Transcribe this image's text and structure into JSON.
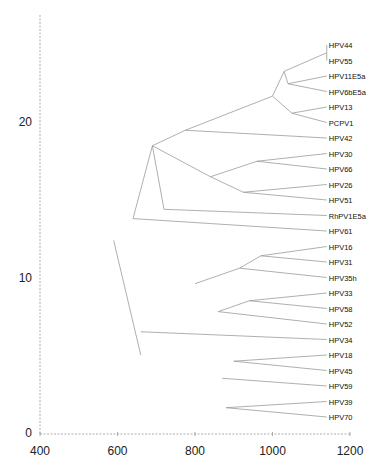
{
  "chart_data": {
    "type": "dendrogram",
    "title": "",
    "xlabel": "",
    "ylabel": "",
    "xlim": [
      400,
      1200
    ],
    "ylim": [
      0,
      25
    ],
    "x_ticks": [
      400,
      600,
      800,
      1000,
      1200
    ],
    "y_ticks": [
      0,
      10,
      20
    ],
    "grid": false,
    "leaves": [
      {
        "name": "HPV44",
        "x": 1140,
        "y": 25.0
      },
      {
        "name": "HPV55",
        "x": 1140,
        "y": 24.0
      },
      {
        "name": "HPV11E5a",
        "x": 1140,
        "y": 23.0
      },
      {
        "name": "HPV6bE5a",
        "x": 1140,
        "y": 22.0
      },
      {
        "name": "HPV13",
        "x": 1140,
        "y": 21.0
      },
      {
        "name": "PCPV1",
        "x": 1140,
        "y": 20.0
      },
      {
        "name": "HPV42",
        "x": 1140,
        "y": 19.0
      },
      {
        "name": "HPV30",
        "x": 1140,
        "y": 18.0
      },
      {
        "name": "HPV66",
        "x": 1140,
        "y": 17.0
      },
      {
        "name": "HPV26",
        "x": 1140,
        "y": 16.0
      },
      {
        "name": "HPV51",
        "x": 1140,
        "y": 15.0
      },
      {
        "name": "RhPV1E5a",
        "x": 1140,
        "y": 14.0
      },
      {
        "name": "HPV61",
        "x": 1140,
        "y": 13.0
      },
      {
        "name": "HPV16",
        "x": 1140,
        "y": 12.0
      },
      {
        "name": "HPV31",
        "x": 1140,
        "y": 11.0
      },
      {
        "name": "HPV35h",
        "x": 1140,
        "y": 10.0
      },
      {
        "name": "HPV33",
        "x": 1140,
        "y": 9.0
      },
      {
        "name": "HPV58",
        "x": 1140,
        "y": 8.0
      },
      {
        "name": "HPV52",
        "x": 1140,
        "y": 7.0
      },
      {
        "name": "HPV34",
        "x": 1140,
        "y": 6.0
      },
      {
        "name": "HPV18",
        "x": 1140,
        "y": 5.0
      },
      {
        "name": "HPV45",
        "x": 1140,
        "y": 4.0
      },
      {
        "name": "HPV59",
        "x": 1140,
        "y": 3.0
      },
      {
        "name": "HPV39",
        "x": 1140,
        "y": 2.0
      },
      {
        "name": "HPV70",
        "x": 1140,
        "y": 1.0
      }
    ],
    "branches": [
      [
        [
          1140,
          24.5
        ],
        [
          1140,
          25.0
        ]
      ],
      [
        [
          1140,
          24.5
        ],
        [
          1140,
          24.0
        ]
      ],
      [
        [
          1030,
          23.3
        ],
        [
          1140,
          24.5
        ]
      ],
      [
        [
          1030,
          23.3
        ],
        [
          1040,
          22.5
        ]
      ],
      [
        [
          1040,
          22.5
        ],
        [
          1140,
          23.0
        ]
      ],
      [
        [
          1040,
          22.5
        ],
        [
          1140,
          22.0
        ]
      ],
      [
        [
          1000,
          21.7
        ],
        [
          1030,
          23.3
        ]
      ],
      [
        [
          1000,
          21.7
        ],
        [
          1050,
          20.6
        ]
      ],
      [
        [
          1050,
          20.6
        ],
        [
          1140,
          21.0
        ]
      ],
      [
        [
          1050,
          20.6
        ],
        [
          1140,
          20.0
        ]
      ],
      [
        [
          775,
          19.5
        ],
        [
          1000,
          21.7
        ]
      ],
      [
        [
          775,
          19.5
        ],
        [
          1140,
          19.0
        ]
      ],
      [
        [
          960,
          17.5
        ],
        [
          1140,
          18.0
        ]
      ],
      [
        [
          960,
          17.5
        ],
        [
          1140,
          17.0
        ]
      ],
      [
        [
          925,
          15.5
        ],
        [
          1140,
          16.0
        ]
      ],
      [
        [
          925,
          15.5
        ],
        [
          1140,
          15.0
        ]
      ],
      [
        [
          840,
          16.5
        ],
        [
          960,
          17.5
        ]
      ],
      [
        [
          840,
          16.5
        ],
        [
          925,
          15.5
        ]
      ],
      [
        [
          690,
          18.5
        ],
        [
          775,
          19.5
        ]
      ],
      [
        [
          690,
          18.5
        ],
        [
          840,
          16.5
        ]
      ],
      [
        [
          720,
          14.4
        ],
        [
          1140,
          14.0
        ]
      ],
      [
        [
          690,
          18.5
        ],
        [
          720,
          14.4
        ]
      ],
      [
        [
          640,
          13.8
        ],
        [
          690,
          18.5
        ]
      ],
      [
        [
          640,
          13.8
        ],
        [
          1140,
          13.0
        ]
      ],
      [
        [
          970,
          11.4
        ],
        [
          1140,
          12.0
        ]
      ],
      [
        [
          970,
          11.4
        ],
        [
          1140,
          11.0
        ]
      ],
      [
        [
          915,
          10.6
        ],
        [
          970,
          11.4
        ]
      ],
      [
        [
          915,
          10.6
        ],
        [
          1140,
          10.0
        ]
      ],
      [
        [
          800,
          9.6
        ],
        [
          915,
          10.6
        ]
      ],
      [
        [
          940,
          8.5
        ],
        [
          1140,
          9.0
        ]
      ],
      [
        [
          940,
          8.5
        ],
        [
          1140,
          8.0
        ]
      ],
      [
        [
          860,
          7.8
        ],
        [
          940,
          8.5
        ]
      ],
      [
        [
          860,
          7.8
        ],
        [
          1140,
          7.0
        ]
      ],
      [
        [
          660,
          6.5
        ],
        [
          1140,
          6.0
        ]
      ],
      [
        [
          900,
          4.6
        ],
        [
          1140,
          5.0
        ]
      ],
      [
        [
          900,
          4.6
        ],
        [
          1140,
          4.0
        ]
      ],
      [
        [
          870,
          3.5
        ],
        [
          1140,
          3.0
        ]
      ],
      [
        [
          880,
          1.6
        ],
        [
          1140,
          2.0
        ]
      ],
      [
        [
          880,
          1.6
        ],
        [
          1140,
          1.0
        ]
      ],
      [
        [
          590,
          12.4
        ],
        [
          660,
          5.0
        ]
      ]
    ]
  },
  "axes": {
    "x_tick_labels": [
      "400",
      "600",
      "800",
      "1000",
      "1200"
    ],
    "y_tick_labels": [
      "0",
      "10",
      "20"
    ]
  },
  "leaf_labels": [
    "HPV44",
    "HPV55",
    "HPV11E5a",
    "HPV6bE5a",
    "HPV13",
    "PCPV1",
    "HPV42",
    "HPV30",
    "HPV66",
    "HPV26",
    "HPV51",
    "RhPV1E5a",
    "HPV61",
    "HPV16",
    "HPV31",
    "HPV35h",
    "HPV33",
    "HPV58",
    "HPV52",
    "HPV34",
    "HPV18",
    "HPV45",
    "HPV59",
    "HPV39",
    "HPV70"
  ]
}
